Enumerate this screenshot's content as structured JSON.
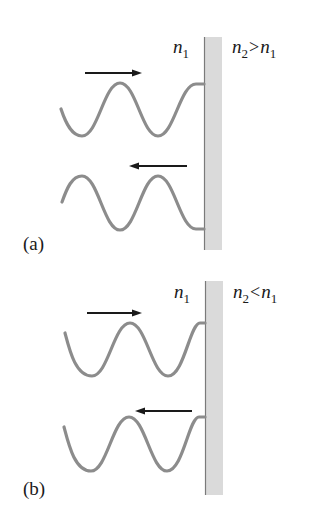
{
  "figure": {
    "panels": [
      {
        "id": "a",
        "label": "(a)",
        "left_medium": {
          "symbol": "n",
          "subscript": "1"
        },
        "right_medium": {
          "symbol": "n",
          "subscript": "2",
          "relation": ">",
          "compare_symbol": "n",
          "compare_subscript": "1"
        },
        "incident_wave": {
          "direction": "right",
          "arrow": "→"
        },
        "reflected_wave": {
          "direction": "left",
          "arrow": "←",
          "phase_shift": "inverted (180°)"
        }
      },
      {
        "id": "b",
        "label": "(b)",
        "left_medium": {
          "symbol": "n",
          "subscript": "1"
        },
        "right_medium": {
          "symbol": "n",
          "subscript": "2",
          "relation": "<",
          "compare_symbol": "n",
          "compare_subscript": "1"
        },
        "incident_wave": {
          "direction": "right",
          "arrow": "→"
        },
        "reflected_wave": {
          "direction": "left",
          "arrow": "←",
          "phase_shift": "none"
        }
      }
    ],
    "colors": {
      "wave": "#8c8c8c",
      "arrow": "#1a1a1a",
      "boundary_fill": "#dadada",
      "boundary_edge": "#7a7a7a",
      "text": "#1a1a1a",
      "background": "#ffffff"
    }
  }
}
